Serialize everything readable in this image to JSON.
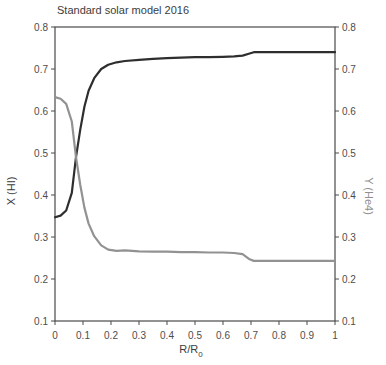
{
  "colors": {
    "background": "#ffffff",
    "axis": "#4a4a4a",
    "tick_text": "#4d4d4d",
    "title_text": "#3c3c3c",
    "curve_x": "#2e2e2e",
    "curve_y": "#929292"
  },
  "chart_data": {
    "type": "line",
    "title": "Standard solar model 2016",
    "xlabel": "R/R0",
    "xlabel_main": "R/R",
    "xlabel_sub": "0",
    "ylabel_left": "X (HI)",
    "ylabel_right": "Y (He4)",
    "xlim": [
      0,
      1
    ],
    "ylim": [
      0.1,
      0.8
    ],
    "x_ticks": [
      "0",
      "0.1",
      "0.2",
      "0.3",
      "0.4",
      "0.5",
      "0.6",
      "0.7",
      "0.8",
      "0.9",
      "1"
    ],
    "y_ticks": [
      "0.8",
      "0.7",
      "0.6",
      "0.5",
      "0.4",
      "0.3",
      "0.2",
      "0.1"
    ],
    "grid": false,
    "legend": "none",
    "frame": "box",
    "series": [
      {
        "id": "x-hydrogen",
        "name": "X (HI)",
        "color": "#2e2e2e",
        "x": [
          0.0,
          0.02,
          0.04,
          0.06,
          0.075,
          0.09,
          0.105,
          0.12,
          0.14,
          0.165,
          0.19,
          0.22,
          0.25,
          0.3,
          0.35,
          0.4,
          0.45,
          0.5,
          0.55,
          0.6,
          0.64,
          0.67,
          0.695,
          0.71,
          0.75,
          0.85,
          1.0
        ],
        "y": [
          0.347,
          0.351,
          0.363,
          0.405,
          0.49,
          0.555,
          0.61,
          0.648,
          0.678,
          0.7,
          0.71,
          0.716,
          0.719,
          0.722,
          0.724,
          0.726,
          0.727,
          0.728,
          0.728,
          0.729,
          0.73,
          0.732,
          0.737,
          0.74,
          0.74,
          0.74,
          0.74
        ]
      },
      {
        "id": "y-helium",
        "name": "Y (He4)",
        "color": "#929292",
        "x": [
          0.0,
          0.02,
          0.04,
          0.06,
          0.075,
          0.09,
          0.105,
          0.12,
          0.14,
          0.165,
          0.19,
          0.22,
          0.25,
          0.3,
          0.35,
          0.4,
          0.45,
          0.5,
          0.55,
          0.6,
          0.64,
          0.67,
          0.695,
          0.71,
          0.75,
          0.85,
          1.0
        ],
        "y": [
          0.633,
          0.629,
          0.617,
          0.575,
          0.49,
          0.425,
          0.37,
          0.332,
          0.302,
          0.28,
          0.27,
          0.267,
          0.268,
          0.266,
          0.265,
          0.265,
          0.264,
          0.264,
          0.263,
          0.263,
          0.262,
          0.259,
          0.247,
          0.243,
          0.243,
          0.243,
          0.243
        ]
      }
    ]
  }
}
